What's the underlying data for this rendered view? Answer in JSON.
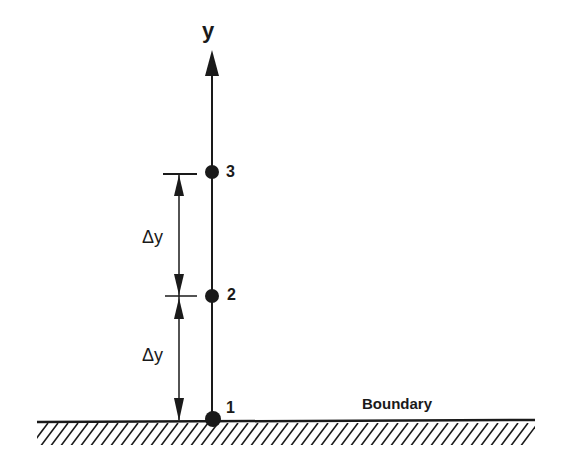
{
  "diagram": {
    "axis_label": "y",
    "boundary_label": "Boundary",
    "points": [
      {
        "label": "1"
      },
      {
        "label": "2"
      },
      {
        "label": "3"
      }
    ],
    "spacing_labels": [
      "Δy",
      "Δy"
    ],
    "colors": {
      "ink": "#1a1a1a",
      "background": "#ffffff"
    }
  }
}
